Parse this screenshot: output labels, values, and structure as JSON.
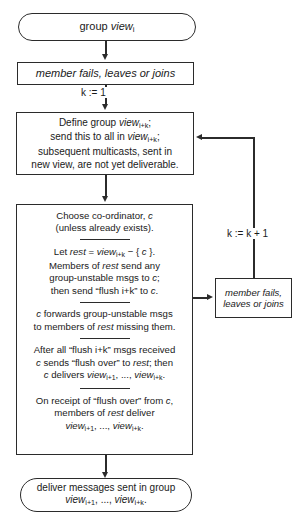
{
  "diagram": {
    "nodes": {
      "start": {
        "shape": "terminator",
        "line1_prefix": "group ",
        "line1_italic": "view",
        "line1_sub": "i"
      },
      "event_top": {
        "shape": "rect",
        "text": "member fails, leaves or joins"
      },
      "define": {
        "shape": "rect",
        "l1_a": "Define group ",
        "l1_it": "view",
        "l1_sub": "i+k",
        "l1_b": ";",
        "l2_a": "send this to all in ",
        "l2_it": "view",
        "l2_sub": "i+k",
        "l2_b": ";",
        "l3": "subsequent multicasts, sent in",
        "l4": "new view, are not yet deliverable."
      },
      "main": {
        "shape": "rect",
        "block1": {
          "l1_a": "Choose co-ordinator, ",
          "l1_it": "c",
          "l2": "(unless already exists)."
        },
        "block2": {
          "l1_a": "Let ",
          "l1_it1": "rest",
          "l1_b": " = ",
          "l1_it2": "view",
          "l1_sub": "i+k",
          "l1_c": " − { ",
          "l1_it3": "c",
          "l1_d": " }.",
          "l2_a": "Members of ",
          "l2_it": "rest",
          "l2_b": " send any",
          "l3_a": "group-unstable msgs to ",
          "l3_it": "c",
          "l3_b": ";",
          "l4_a": "then send “flush i+k” to ",
          "l4_it": "c",
          "l4_b": "."
        },
        "block3": {
          "l1_a": "",
          "l1_it": "c",
          "l1_b": " forwards group-unstable msgs",
          "l2_a": "to members of ",
          "l2_it": "rest",
          "l2_b": " missing them."
        },
        "block4": {
          "l1": "After all “flush i+k” msgs received",
          "l2_it1": "c",
          "l2_a": " sends “flush over” to ",
          "l2_it2": "rest",
          "l2_b": "; then",
          "l3_it1": "c",
          "l3_a": " delivers ",
          "l3_it2": "view",
          "l3_sub1": "i+1",
          "l3_b": ", ..., ",
          "l3_it3": "view",
          "l3_sub2": "i+k",
          "l3_c": "."
        },
        "block5": {
          "l1_a": "On receipt of “flush over” from ",
          "l1_it": "c",
          "l1_b": ",",
          "l2_a": "members of ",
          "l2_it": "rest",
          "l2_b": " deliver",
          "l3_it1": "view",
          "l3_sub1": "i+1",
          "l3_a": ", ..., ",
          "l3_it2": "view",
          "l3_sub2": "i+k",
          "l3_b": "."
        }
      },
      "event_right": {
        "shape": "rect",
        "l1": "member fails,",
        "l2": "leaves or joins"
      },
      "end": {
        "shape": "terminator",
        "l1": "deliver messages sent in group",
        "l2_it1": "view",
        "l2_sub1": "i+1",
        "l2_a": ", ..., ",
        "l2_it2": "view",
        "l2_sub2": "i+k",
        "l2_b": "."
      }
    },
    "edge_labels": {
      "init_k": "k := 1",
      "increment_k": "k := k + 1"
    },
    "colors": {
      "stroke": "#2b2b2b",
      "background": "#ffffff",
      "text": "#1a1a1a"
    }
  }
}
